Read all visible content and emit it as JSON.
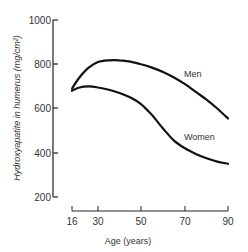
{
  "chart_data": {
    "type": "line",
    "title": "",
    "xlabel": "Age (years)",
    "ylabel": "Hydroxyapatite in humerus (mg/cm²)",
    "x_ticks": [
      "16",
      "30",
      "50",
      "70",
      "90"
    ],
    "y_ticks": [
      "200",
      "400",
      "600",
      "800",
      "1000"
    ],
    "xlim": [
      16,
      90
    ],
    "ylim": [
      200,
      1000
    ],
    "grid": false,
    "series": [
      {
        "name": "Men",
        "x": [
          16,
          20,
          25,
          30,
          35,
          40,
          45,
          50,
          55,
          60,
          65,
          70,
          75,
          80,
          85,
          90
        ],
        "values": [
          690,
          740,
          785,
          810,
          818,
          818,
          812,
          800,
          785,
          765,
          740,
          710,
          675,
          640,
          600,
          555
        ]
      },
      {
        "name": "Women",
        "x": [
          16,
          20,
          25,
          30,
          35,
          40,
          45,
          50,
          55,
          60,
          65,
          70,
          75,
          80,
          85,
          90
        ],
        "values": [
          680,
          695,
          700,
          695,
          685,
          670,
          650,
          620,
          570,
          510,
          455,
          420,
          395,
          375,
          360,
          350
        ]
      }
    ],
    "annotations": [
      "Men",
      "Women"
    ]
  }
}
